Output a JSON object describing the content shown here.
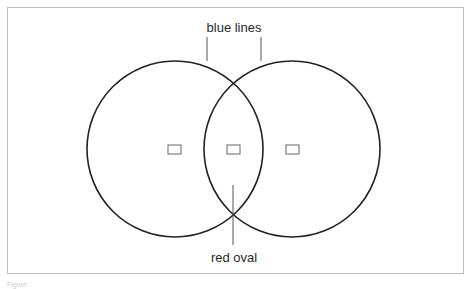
{
  "labels": {
    "top": "blue lines",
    "bottom": "red oval"
  },
  "caption": "Figure",
  "shapes": {
    "circles": [
      {
        "name": "left-circle",
        "cx": 175,
        "cy": 149,
        "r": 88
      },
      {
        "name": "right-circle",
        "cx": 292,
        "cy": 149,
        "r": 88
      }
    ],
    "boxes": [
      {
        "name": "left-box",
        "x": 168,
        "y": 145,
        "w": 13,
        "h": 9
      },
      {
        "name": "middle-box",
        "x": 227,
        "y": 145,
        "w": 13,
        "h": 9
      },
      {
        "name": "right-box",
        "x": 286,
        "y": 145,
        "w": 13,
        "h": 9
      }
    ]
  },
  "colors": {
    "stroke": "#222222",
    "leader": "#555555",
    "box": "#666666",
    "frame": "#bdbdbd"
  }
}
